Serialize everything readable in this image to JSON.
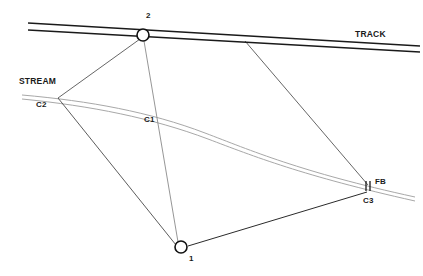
{
  "diagram": {
    "canvas": {
      "width": 423,
      "height": 276,
      "background": "#ffffff"
    },
    "colors": {
      "track": "#1a1a1a",
      "stream": "#a8a8a8",
      "survey_line": "#4a4a4a",
      "survey_line_dark": "#2b2b2b",
      "node_stroke": "#111111",
      "label_text": "#1a1a1a"
    },
    "labels": {
      "track": "TRACK",
      "stream": "STREAM",
      "station_1": "1",
      "station_2": "2",
      "chainage_1": "C1",
      "chainage_2": "C2",
      "chainage_3": "C3",
      "footbridge": "FB"
    },
    "features": [
      {
        "name": "track",
        "kind": "railway",
        "label": "TRACK",
        "rails": [
          {
            "x1": 28,
            "y1": 23,
            "x2": 420,
            "y2": 46
          },
          {
            "x1": 28,
            "y1": 30,
            "x2": 420,
            "y2": 52
          }
        ]
      },
      {
        "name": "stream",
        "kind": "watercourse",
        "label": "STREAM",
        "banks": [
          {
            "path": "M 22 95 C 90 101, 150 112, 205 133 C 250 150, 300 172, 415 197"
          },
          {
            "path": "M 22 99 C 92 106, 152 118, 208 139 C 253 156, 303 176, 415 201"
          }
        ]
      }
    ],
    "stations": [
      {
        "name": "station-2",
        "label": "2",
        "x": 143,
        "y": 35,
        "r": 6
      },
      {
        "name": "station-1",
        "label": "1",
        "x": 181,
        "y": 247,
        "r": 6
      }
    ],
    "markers": [
      {
        "name": "chainage-c2",
        "label": "C2",
        "x": 58,
        "y": 98
      },
      {
        "name": "chainage-c1",
        "label": "C1",
        "x": 157,
        "y": 113
      },
      {
        "name": "chainage-c3",
        "label": "C3",
        "x": 368,
        "y": 193
      },
      {
        "name": "footbridge",
        "label": "FB",
        "x": 368,
        "y": 186
      }
    ],
    "survey_lines": [
      {
        "name": "line-2-to-c2",
        "from": "2",
        "to": "C2",
        "x1": 140,
        "y1": 39,
        "x2": 58,
        "y2": 98
      },
      {
        "name": "line-2-to-1",
        "from": "2",
        "to": "1",
        "x1": 144,
        "y1": 41,
        "x2": 178,
        "y2": 242
      },
      {
        "name": "line-c2-to-1",
        "from": "C2",
        "to": "1",
        "x1": 58,
        "y1": 98,
        "x2": 176,
        "y2": 245
      },
      {
        "name": "line-1-to-c3",
        "from": "1",
        "to": "C3",
        "x1": 188,
        "y1": 246,
        "x2": 367,
        "y2": 192
      },
      {
        "name": "line-track-to-fb",
        "from": "TRACK",
        "to": "FB",
        "x1": 245,
        "y1": 41,
        "x2": 368,
        "y2": 185
      }
    ]
  }
}
